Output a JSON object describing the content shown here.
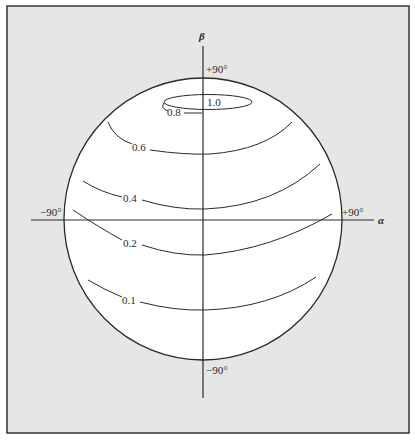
{
  "figure": {
    "background_color": "#e6e6e6",
    "sphere_color": "#ffffff",
    "line_color": "#2a2a2a",
    "axes": {
      "horizontal": {
        "name": "α",
        "min_label": "−90°",
        "max_label": "+90°"
      },
      "vertical": {
        "name": "β",
        "max_label": "+90°",
        "min_label": "−90°"
      }
    },
    "contours": [
      {
        "label": "1.0",
        "value": 1.0
      },
      {
        "label": "0.8",
        "value": 0.8
      },
      {
        "label": "0.6",
        "value": 0.6
      },
      {
        "label": "0.4",
        "value": 0.4
      },
      {
        "label": "0.2",
        "value": 0.2
      },
      {
        "label": "0.1",
        "value": 0.1
      }
    ]
  }
}
